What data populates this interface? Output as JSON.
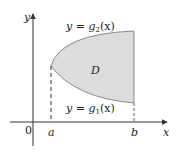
{
  "diagram": {
    "axes": {
      "x_label": "x",
      "y_label": "y",
      "origin_label": "0"
    },
    "ticks": {
      "a": "a",
      "b": "b"
    },
    "region": {
      "label": "D",
      "fill_color": "#dcdcdc",
      "stroke_color": "#8a8a8a"
    },
    "curves": {
      "upper": {
        "prefix": "y = g",
        "subscript": "2",
        "suffix": "(x)"
      },
      "lower": {
        "prefix": "y = g",
        "subscript": "1",
        "suffix": "(x)"
      }
    }
  }
}
